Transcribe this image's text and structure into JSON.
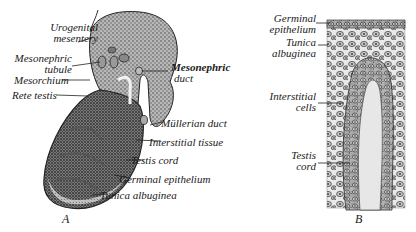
{
  "figure": {
    "panel_a": {
      "letter": "A",
      "labels": {
        "urogenital_mesentery_1": "Urogenital",
        "urogenital_mesentery_2": "mesentery",
        "mesonephric_tubule_1": "Mesonephric",
        "mesonephric_tubule_2": "tubule",
        "mesorchium": "Mesorchium",
        "rete_testis": "Rete testis",
        "mesonephric_duct_1": "Mesonephric",
        "mesonephric_duct_2": "duct",
        "mullerian_duct": "Müllerian duct",
        "interstitial_tissue": "Interstitial tissue",
        "testis_cord": "Testis cord",
        "germinal_epithelium": "Germinal epithelium",
        "tunica_albuginea": "Tunica albuginea"
      }
    },
    "panel_b": {
      "letter": "B",
      "labels": {
        "germinal_epithelium_1": "Germinal",
        "germinal_epithelium_2": "epithelium",
        "tunica_albuginea_1": "Tunica",
        "tunica_albuginea_2": "albuginea",
        "interstitial_cells_1": "Interstitial",
        "interstitial_cells_2": "cells",
        "testis_cord_1": "Testis",
        "testis_cord_2": "cord"
      }
    },
    "colors": {
      "tissue_dark": "#3a3a3a",
      "tissue_mid": "#8a8a8a",
      "tissue_light": "#cfcfcf",
      "ink": "#1a1a1a",
      "background": "#ffffff"
    }
  }
}
